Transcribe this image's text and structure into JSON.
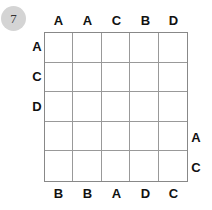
{
  "puzzle": {
    "number": "7",
    "rows": 5,
    "cols": 5,
    "clues": {
      "top": [
        "A",
        "A",
        "C",
        "B",
        "D"
      ],
      "bottom": [
        "B",
        "B",
        "A",
        "D",
        "C"
      ],
      "left": [
        "A",
        "C",
        "D",
        "",
        ""
      ],
      "right": [
        "",
        "",
        "",
        "A",
        "C"
      ]
    },
    "cells": [
      [
        "",
        "",
        "",
        "",
        ""
      ],
      [
        "",
        "",
        "",
        "",
        ""
      ],
      [
        "",
        "",
        "",
        "",
        ""
      ],
      [
        "",
        "",
        "",
        "",
        ""
      ],
      [
        "",
        "",
        "",
        "",
        ""
      ]
    ]
  }
}
